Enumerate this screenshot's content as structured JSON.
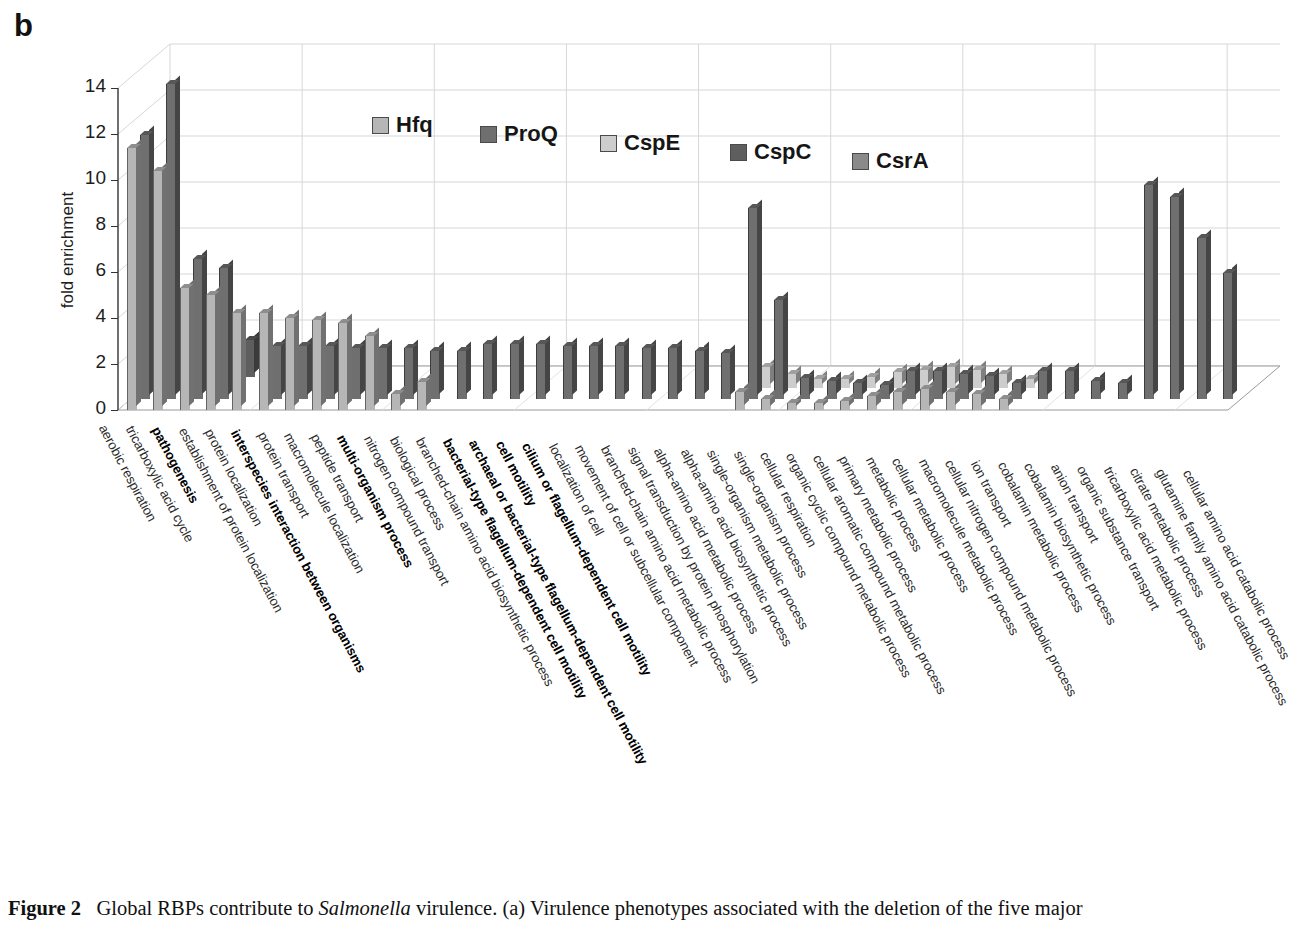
{
  "panel_letter": "b",
  "caption": {
    "figure_label": "Figure 2",
    "text_1": "Global RBPs contribute to ",
    "italic_1": "Salmonella",
    "text_2": " virulence. (a) Virulence phenotypes associated with the deletion of the five major"
  },
  "legend": {
    "position": "inside-top-center",
    "entries": [
      {
        "name": "Hfq",
        "color": "#b6b6b6"
      },
      {
        "name": "ProQ",
        "color": "#6f6f6f"
      },
      {
        "name": "CspE",
        "color": "#cdcdcd"
      },
      {
        "name": "CspC",
        "color": "#5e5e5e"
      },
      {
        "name": "CsrA",
        "color": "#8a8a8a"
      }
    ]
  },
  "chart_data": {
    "type": "bar",
    "title": "",
    "subtitle": "",
    "xlabel": "",
    "ylabel": "fold enrichment",
    "ylim": [
      0,
      14
    ],
    "yticks": [
      0,
      2,
      4,
      6,
      8,
      10,
      12,
      14
    ],
    "grid": true,
    "projection": "3d",
    "legend_position": "inside-top-center",
    "categories": [
      "aerobic respiration",
      "tricarboxylic acid cycle",
      "pathogenesis",
      "establishment of protein localization",
      "protein localization",
      "interspecies interaction between organisms",
      "protein transport",
      "macromolecule localization",
      "peptide transport",
      "multi-organism process",
      "nitrogen compound transport",
      "biological process",
      "branched-chain amino acid biosynthetic process",
      "bacterial-type flagellum-dependent cell motility",
      "archaeal or bacterial-type flagellum-dependent cell motility",
      "cell motility",
      "cilium or flagellum-dependent cell motility",
      "localization of cell",
      "movement of cell or subcellular component",
      "branched-chain amino acid metabolic process",
      "signal transduction by protein phosphorylation",
      "alpha-amino acid metabolic process",
      "alpha-amino acid biosynthetic process",
      "single-organism metabolic process",
      "single-organism process",
      "cellular respiration",
      "organic cyclic compound metabolic process",
      "cellular aromatic compound metabolic process",
      "primary metabolic process",
      "metabolic process",
      "cellular metabolic process",
      "macromolecule metabolic process",
      "cellular nitrogen compound metabolic process",
      "ion transport",
      "cobalamin metabolic process",
      "cobalamin biosynthetic process",
      "anion transport",
      "organic substance transport",
      "tricarboxylic acid metabolic process",
      "citrate metabolic process",
      "glutamine family amino acid catabolic process",
      "cellular amino acid catabolic process"
    ],
    "categories_bold": [
      "pathogenesis",
      "interspecies interaction between organisms",
      "multi-organism process",
      "bacterial-type flagellum-dependent cell motility",
      "archaeal or bacterial-type flagellum-dependent cell motility",
      "cell motility",
      "cilium or flagellum-dependent cell motility"
    ],
    "series": [
      {
        "name": "Hfq",
        "color": "#b6b6b6",
        "values": [
          11.4,
          10.4,
          5.3,
          5.0,
          4.2,
          4.2,
          4.0,
          3.9,
          3.8,
          3.2,
          0.7,
          1.2,
          0,
          0,
          0,
          0,
          0,
          0,
          0,
          0,
          0,
          0,
          0,
          0.8,
          0.5,
          0.3,
          0.3,
          0.4,
          0.6,
          0.8,
          0.9,
          0.8,
          0.7,
          0.5,
          0,
          0,
          0,
          0,
          0,
          0,
          0,
          0
        ]
      },
      {
        "name": "ProQ",
        "color": "#6f6f6f",
        "values": [
          11.5,
          13.7,
          6.1,
          5.7,
          0,
          2.3,
          2.3,
          2.3,
          2.2,
          2.2,
          2.2,
          2.1,
          2.1,
          2.4,
          2.4,
          2.4,
          2.3,
          2.3,
          2.3,
          2.2,
          2.2,
          2.1,
          2.0,
          8.3,
          4.3,
          0.9,
          0.8,
          0.7,
          0.6,
          1.2,
          1.2,
          1.1,
          1.0,
          0.7,
          1.2,
          1.2,
          0.8,
          0.7,
          9.3,
          8.8,
          7.0,
          5.5
        ]
      },
      {
        "name": "CspE",
        "color": "#cdcdcd",
        "values": [
          0,
          0,
          0,
          0,
          0,
          0,
          0,
          0,
          0,
          0,
          0,
          0,
          0,
          0,
          0,
          0,
          0,
          0,
          0,
          0,
          0,
          0,
          0,
          0.9,
          0.6,
          0.4,
          0.4,
          0.5,
          0.7,
          0.8,
          0.9,
          0.8,
          0.6,
          0.4,
          0,
          0,
          0,
          0,
          0,
          0,
          0,
          0
        ]
      },
      {
        "name": "CspC",
        "color": "#5e5e5e",
        "values": [
          0,
          1.8,
          0,
          1.6,
          0,
          1.1,
          1.0,
          0.9,
          1.0,
          0.8,
          0.6,
          0,
          0,
          0,
          0,
          0,
          0,
          0,
          0,
          0,
          0,
          0,
          0,
          0,
          0,
          0,
          0,
          0,
          0,
          0,
          0,
          0,
          0,
          0,
          0,
          0,
          0,
          0,
          0,
          0,
          0,
          0
        ]
      },
      {
        "name": "CsrA",
        "color": "#8a8a8a",
        "values": [
          0,
          0,
          0,
          0,
          0,
          0,
          0,
          0,
          0,
          0,
          0,
          0,
          0,
          0,
          0,
          0,
          0,
          0,
          0,
          0,
          0,
          0,
          0,
          0,
          0,
          0,
          0,
          0,
          0,
          0,
          0,
          0,
          0,
          0,
          0,
          0,
          0,
          0,
          0,
          0,
          0,
          0
        ]
      }
    ]
  }
}
